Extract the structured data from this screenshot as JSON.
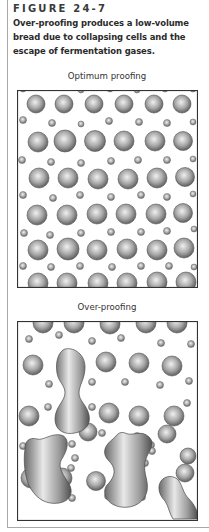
{
  "figure": {
    "label": "FIGURE 24-7",
    "caption_lines": [
      "Over-proofing produces a low-volume",
      "bread due to collapsing cells and the",
      "escape of fermentation gases."
    ]
  },
  "panels": [
    {
      "title": "Optimum proofing",
      "width": 180,
      "height": 197,
      "large_cells": [
        [
          19,
          14,
          9
        ],
        [
          47,
          14,
          9
        ],
        [
          77,
          14,
          9
        ],
        [
          107,
          14,
          9
        ],
        [
          137,
          14,
          9
        ],
        [
          165,
          14,
          9
        ],
        [
          21,
          52,
          10
        ],
        [
          48,
          51,
          11
        ],
        [
          78,
          51,
          10.5
        ],
        [
          107,
          51,
          10
        ],
        [
          138,
          51,
          10
        ],
        [
          166,
          51,
          9.5
        ],
        [
          22,
          88,
          10
        ],
        [
          51,
          88,
          10
        ],
        [
          81,
          89,
          10
        ],
        [
          111,
          89,
          10
        ],
        [
          140,
          88,
          10
        ],
        [
          168,
          87,
          9.5
        ],
        [
          20,
          125,
          10
        ],
        [
          50,
          125,
          10
        ],
        [
          80,
          124,
          10
        ],
        [
          109,
          124,
          10
        ],
        [
          139,
          124,
          10
        ],
        [
          166,
          123,
          9.5
        ],
        [
          21,
          160,
          10
        ],
        [
          51,
          159,
          11
        ],
        [
          80,
          160,
          10
        ],
        [
          110,
          159,
          10
        ],
        [
          140,
          160,
          10
        ],
        [
          167,
          158,
          10
        ],
        [
          21,
          193,
          10
        ],
        [
          50,
          193,
          10
        ],
        [
          81,
          193,
          10
        ],
        [
          110,
          193,
          10
        ],
        [
          140,
          192,
          10
        ],
        [
          169,
          192,
          10
        ]
      ],
      "small_cells": [
        [
          6,
          -1,
          3
        ],
        [
          34,
          -3,
          3
        ],
        [
          64,
          0,
          3
        ],
        [
          93,
          -1,
          3
        ],
        [
          120,
          0,
          3
        ],
        [
          148,
          -1,
          3
        ],
        [
          176,
          -1,
          3
        ],
        [
          6,
          30,
          3.5
        ],
        [
          35,
          33,
          3.5
        ],
        [
          64,
          34,
          3
        ],
        [
          92,
          31,
          3.5
        ],
        [
          122,
          32,
          3.5
        ],
        [
          150,
          33,
          3.5
        ],
        [
          176,
          32,
          3
        ],
        [
          5,
          70,
          3.5
        ],
        [
          34,
          72,
          3.5
        ],
        [
          64,
          73,
          3.5
        ],
        [
          94,
          71,
          3.5
        ],
        [
          121,
          70,
          3.5
        ],
        [
          150,
          70,
          3.5
        ],
        [
          176,
          69,
          3
        ],
        [
          6,
          105,
          3.5
        ],
        [
          36,
          108,
          3.5
        ],
        [
          63,
          105,
          3.5
        ],
        [
          94,
          107,
          3.5
        ],
        [
          124,
          105,
          3.5
        ],
        [
          150,
          107,
          3.5
        ],
        [
          176,
          104,
          3
        ],
        [
          7,
          143,
          3.5
        ],
        [
          33,
          145,
          3.5
        ],
        [
          64,
          143,
          3.5
        ],
        [
          94,
          142,
          3.5
        ],
        [
          124,
          142,
          3.5
        ],
        [
          150,
          141,
          3.5
        ],
        [
          177,
          139,
          3
        ],
        [
          6,
          176,
          3.5
        ],
        [
          34,
          177,
          3.5
        ],
        [
          63,
          176,
          3.5
        ],
        [
          95,
          177,
          3.5
        ],
        [
          124,
          176,
          3.5
        ],
        [
          152,
          176,
          3.5
        ],
        [
          177,
          177,
          3
        ]
      ]
    },
    {
      "title": "Over-proofing",
      "width": 180,
      "height": 199,
      "large_cells": [
        [
          26,
          2,
          10
        ],
        [
          57,
          2,
          10
        ],
        [
          93,
          3,
          10
        ],
        [
          129,
          2,
          10
        ],
        [
          160,
          2,
          10
        ],
        [
          16,
          44,
          10
        ],
        [
          89,
          41,
          10
        ],
        [
          122,
          42,
          10
        ],
        [
          155,
          45,
          10
        ],
        [
          12,
          95,
          10
        ],
        [
          92,
          92,
          10
        ],
        [
          122,
          95,
          10
        ],
        [
          157,
          95,
          10
        ],
        [
          71,
          111,
          9
        ],
        [
          150,
          113,
          9
        ],
        [
          171,
          135,
          8
        ],
        [
          14,
          157,
          10
        ],
        [
          45,
          157,
          10
        ],
        [
          79,
          160,
          9.5
        ],
        [
          116,
          159,
          10
        ],
        [
          168,
          152,
          9
        ]
      ],
      "small_cells": [
        [
          12,
          18,
          3.5
        ],
        [
          42,
          14,
          3.5
        ],
        [
          75,
          20,
          3.5
        ],
        [
          104,
          17,
          3.5
        ],
        [
          144,
          22,
          3.5
        ],
        [
          174,
          23,
          3.5
        ],
        [
          32,
          63,
          3.5
        ],
        [
          75,
          61,
          3.5
        ],
        [
          108,
          61,
          3.5
        ],
        [
          143,
          64,
          3.5
        ],
        [
          172,
          60,
          3.5
        ],
        [
          31,
          86,
          3.5
        ],
        [
          75,
          86,
          3.5
        ],
        [
          170,
          82,
          3.5
        ],
        [
          6,
          125,
          3.5
        ],
        [
          55,
          123,
          3.5
        ],
        [
          58,
          137,
          3.5
        ],
        [
          85,
          112,
          3.5
        ],
        [
          120,
          115,
          3.5
        ],
        [
          128,
          142,
          3.5
        ],
        [
          134,
          124,
          3.5
        ],
        [
          54,
          147,
          3.5
        ],
        [
          135,
          130,
          3.5
        ],
        [
          27,
          176,
          3.5
        ],
        [
          55,
          177,
          3.5
        ],
        [
          91,
          175,
          3.5
        ],
        [
          125,
          176,
          3.5
        ],
        [
          160,
          177,
          3.5
        ]
      ],
      "blobs": [
        {
          "name": "elongated-cell-upper",
          "d": "M48,28 C42,30 38,40 40,52 C42,62 48,64 48,72 C48,80 38,86 38,98 C38,110 48,114 58,112 C68,110 74,104 72,94 C70,84 62,80 62,72 C62,64 68,58 68,46 C68,34 58,26 48,28 Z"
        },
        {
          "name": "collapsed-cell-left",
          "d": "M8,128 C6,140 8,160 14,168 C20,178 30,184 42,182 C54,180 58,170 50,160 C44,150 40,144 46,136 C52,126 52,116 44,114 C34,112 26,120 20,118 C12,116 8,120 8,128 Z"
        },
        {
          "name": "collapsed-cell-center",
          "d": "M96,118 C88,124 84,132 92,140 C100,148 98,156 90,164 C84,172 90,184 104,186 C118,188 128,180 130,170 C132,160 126,152 128,142 C130,130 140,124 132,116 C124,108 116,116 108,112 C102,110 100,114 96,118 Z"
        },
        {
          "name": "elongated-cell-lower-right",
          "d": "M144,160 C140,166 142,174 148,180 C152,186 152,192 156,198 L180,198 C182,192 178,184 172,178 C166,172 166,166 162,160 C158,154 148,154 144,160 Z"
        }
      ]
    }
  ],
  "colors": {
    "cell_light": "#f0f0f0",
    "cell_mid": "#a9a9a9",
    "cell_dark": "#5a5a5a",
    "frame": "#333333",
    "panel_border": "#a8a8a8",
    "text": "#2b2b2b"
  }
}
